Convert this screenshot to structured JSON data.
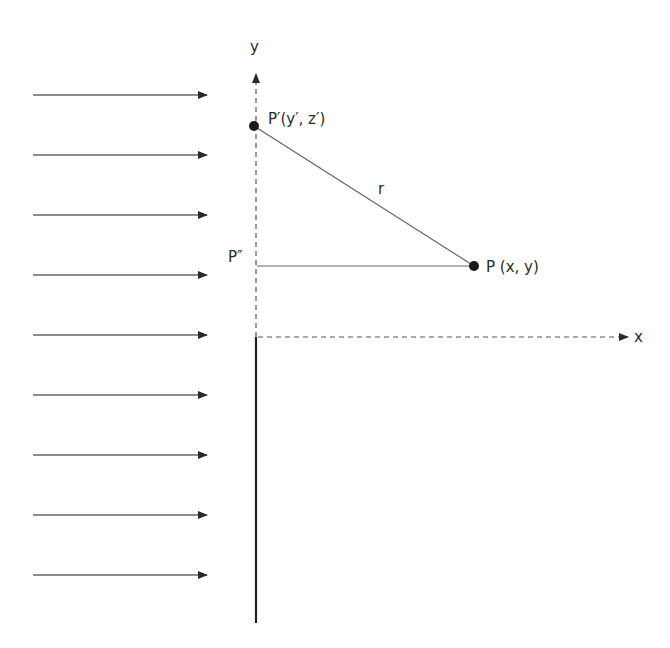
{
  "diagram": {
    "colors": {
      "line": "#555555",
      "dark": "#222222",
      "background": "#ffffff"
    },
    "axes": {
      "x_label": "x",
      "y_label": "y"
    },
    "points": {
      "p_prime": {
        "label": "P′(y′, z′)",
        "x": 254,
        "y": 126
      },
      "p": {
        "label": "P (x, y)",
        "x": 474,
        "y": 266
      },
      "p_double_prime": {
        "label": "P″",
        "x": 256,
        "y": 266
      }
    },
    "distance_label": "r",
    "incident_rays": {
      "count": 9,
      "x_start": 33,
      "x_end": 207,
      "y_positions": [
        95,
        155,
        215,
        275,
        335,
        395,
        455,
        515,
        575
      ]
    },
    "wall": {
      "x": 256,
      "y_top": 337,
      "y_bottom": 623
    }
  }
}
